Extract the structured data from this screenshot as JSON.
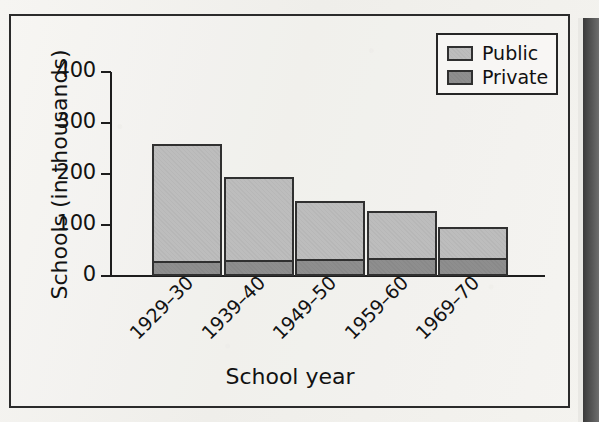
{
  "chart_data": {
    "type": "bar",
    "subtype": "stacked-bar",
    "title": "",
    "xlabel": "School year",
    "ylabel": "Schools (in thousands)",
    "categories": [
      "1929–30",
      "1939–40",
      "1949–50",
      "1959–60",
      "1969–70"
    ],
    "series": [
      {
        "name": "Private",
        "values": [
          29,
          32,
          33,
          35,
          35
        ],
        "color": "#8e8e8e"
      },
      {
        "name": "Public",
        "values": [
          230,
          162,
          114,
          93,
          61
        ],
        "color": "#bdbdbd"
      }
    ],
    "totals": [
      259,
      194,
      147,
      128,
      96
    ],
    "ylim": [
      0,
      400
    ],
    "yticks": [
      0,
      100,
      200,
      300,
      400
    ],
    "ytick_labels": [
      "0",
      "100",
      "200",
      "300",
      "400"
    ],
    "grid": false,
    "legend_position": "top-right",
    "xtick_rotation": -45
  },
  "legend": {
    "items": [
      {
        "label": "Public",
        "swatch": "public-swatch"
      },
      {
        "label": "Private",
        "swatch": "private-swatch"
      }
    ]
  },
  "axes": {
    "y_title": "Schools (in thousands)",
    "x_title": "School year"
  },
  "ticks": {
    "y": [
      "400",
      "300",
      "200",
      "100",
      "0"
    ],
    "x": [
      "1929–30",
      "1939–40",
      "1949–50",
      "1959–60",
      "1969–70"
    ]
  },
  "colors": {
    "public": "#bdbdbd",
    "private": "#8e8e8e",
    "outline": "#303030",
    "axis": "#1d1d1d",
    "paper": "#f2f1ee"
  }
}
